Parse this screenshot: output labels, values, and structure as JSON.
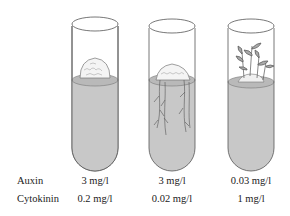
{
  "figure": {
    "title": "",
    "colors": {
      "medium": "#c8c8c8",
      "medium_top": "#b9b9b9",
      "outline": "#555555",
      "callus": "#f2f2f2",
      "plant": "#666666"
    }
  },
  "rows": [
    {
      "label": "Auxin"
    },
    {
      "label": "Cytokinin"
    }
  ],
  "tubes": [
    {
      "name": "tube-callus",
      "content": "callus",
      "auxin": "3 mg/l",
      "cytokinin": "0.2 mg/l"
    },
    {
      "name": "tube-roots",
      "content": "callus with roots",
      "auxin": "3 mg/l",
      "cytokinin": "0.02 mg/l"
    },
    {
      "name": "tube-shoots",
      "content": "callus with shoots",
      "auxin": "0.03 mg/l",
      "cytokinin": "1 mg/l"
    }
  ]
}
